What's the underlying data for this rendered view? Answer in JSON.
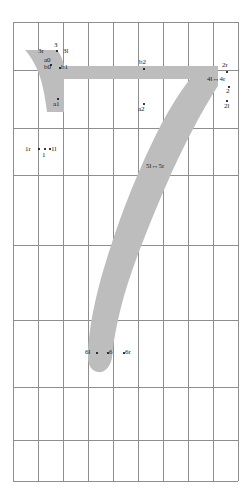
{
  "view": {
    "title": "glyph-outline-editor",
    "glyph_character": "7",
    "background_color": "#ffffff",
    "glyph_fill_color": "#bdbdbd",
    "grid_line_color": "#8e8e8e",
    "label_color": "#1a1a1a"
  },
  "grid": {
    "columns": 9,
    "rows": 8,
    "left": 13,
    "right": 238,
    "top": 22,
    "bottom": 481,
    "vertical_lines": [
      13,
      38,
      63,
      88,
      113,
      138,
      163,
      188,
      213,
      238
    ],
    "horizontal_lines": [
      22,
      70,
      128,
      175,
      245,
      320,
      387,
      440,
      481
    ]
  },
  "labels": {
    "p3r": "3r",
    "p3": "3",
    "p3l": "3l",
    "a0": "a0",
    "b0": "b0",
    "b1": "b1",
    "a1": "a1",
    "b2": "b2",
    "a2": "a2",
    "p2r": "2r",
    "p4l_4r": "4l↔4r",
    "p2": "2",
    "p2l": "2l",
    "p1r": "1r",
    "p1l": "1l",
    "p1": "1",
    "p5l_5r": "5l↔5r",
    "p6l": "6l",
    "p6": "6",
    "p6r": "6r"
  }
}
